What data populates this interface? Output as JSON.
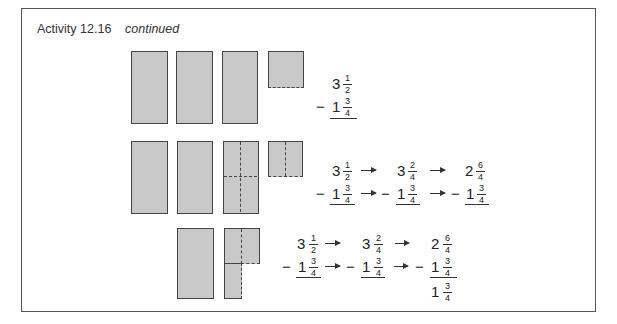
{
  "header": {
    "label": "Activity 12.16",
    "status": "continued"
  },
  "row1": {
    "minuend": {
      "whole": "3",
      "num": "1",
      "den": "2"
    },
    "subtrahend": {
      "sign": "−",
      "whole": "1",
      "num": "3",
      "den": "4"
    }
  },
  "row2": {
    "steps": [
      {
        "minuend": {
          "whole": "3",
          "num": "1",
          "den": "2"
        },
        "subtrahend": {
          "sign": "−",
          "whole": "1",
          "num": "3",
          "den": "4"
        }
      },
      {
        "minuend": {
          "whole": "3",
          "num": "2",
          "den": "4"
        },
        "subtrahend": {
          "sign": "−",
          "whole": "1",
          "num": "3",
          "den": "4"
        }
      },
      {
        "minuend": {
          "whole": "2",
          "num": "6",
          "den": "4"
        },
        "subtrahend": {
          "sign": "−",
          "whole": "1",
          "num": "3",
          "den": "4"
        }
      }
    ]
  },
  "row3": {
    "steps": [
      {
        "minuend": {
          "whole": "3",
          "num": "1",
          "den": "2"
        },
        "subtrahend": {
          "sign": "−",
          "whole": "1",
          "num": "3",
          "den": "4"
        }
      },
      {
        "minuend": {
          "whole": "3",
          "num": "2",
          "den": "4"
        },
        "subtrahend": {
          "sign": "−",
          "whole": "1",
          "num": "3",
          "den": "4"
        }
      },
      {
        "minuend": {
          "whole": "2",
          "num": "6",
          "den": "4"
        },
        "subtrahend": {
          "sign": "−",
          "whole": "1",
          "num": "3",
          "den": "4"
        }
      }
    ],
    "result": {
      "whole": "1",
      "num": "3",
      "den": "4"
    }
  },
  "colors": {
    "block_fill": "#c9c9c9",
    "block_border": "#444444",
    "frame_border": "#555555"
  }
}
